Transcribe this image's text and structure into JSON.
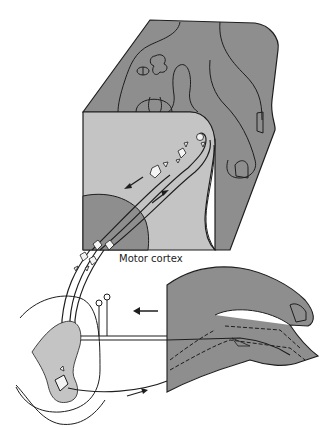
{
  "figure": {
    "labels": {
      "motor_cortex": "Motor cortex"
    },
    "colors": {
      "background": "#ffffff",
      "dark_tissue": "#8e8e8e",
      "light_tissue": "#c4c4c4",
      "outline": "#1e1e1e",
      "neuron_fill": "#f4f4f4"
    },
    "components": [
      "brain-block-surface",
      "motor-cortex-section",
      "descending-pathway",
      "ascending-pathway",
      "spinal-cord-section",
      "finger-section",
      "sensory-input-arrow",
      "motor-output-arrow"
    ]
  }
}
